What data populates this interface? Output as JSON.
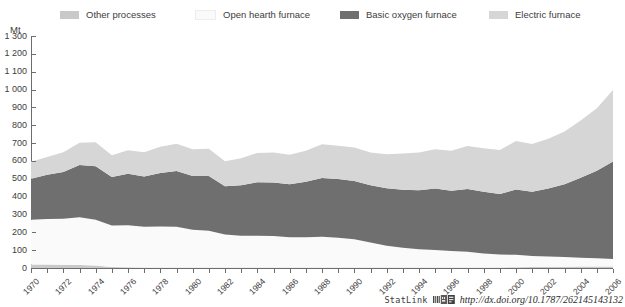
{
  "legend": {
    "position": "top",
    "items": [
      {
        "label": "Other processes",
        "color": "#c9c9c9"
      },
      {
        "label": "Open hearth furnace",
        "color": "#fafafa"
      },
      {
        "label": "Basic oxygen furnace",
        "color": "#6f6f6f"
      },
      {
        "label": "Electric furnace",
        "color": "#d6d6d6"
      }
    ]
  },
  "footer": {
    "statlink_label": "StatLink",
    "statlink_icon": "statlink-barcode-icon",
    "url": "http://dx.doi.org/10.1787/262145143132"
  },
  "chart_data": {
    "type": "area",
    "stacked": true,
    "title": "",
    "subtitle": "",
    "xlabel": "",
    "ylabel": "Mt",
    "ylim": [
      0,
      1300
    ],
    "ytick_step": 100,
    "ytick_labels": [
      "0",
      "100",
      "200",
      "300",
      "400",
      "500",
      "600",
      "700",
      "800",
      "900",
      "1 000",
      "1 100",
      "1 200",
      "1 300"
    ],
    "grid": false,
    "xlim": [
      1970,
      2006
    ],
    "x": [
      1970,
      1971,
      1972,
      1973,
      1974,
      1975,
      1976,
      1977,
      1978,
      1979,
      1980,
      1981,
      1982,
      1983,
      1984,
      1985,
      1986,
      1987,
      1988,
      1989,
      1990,
      1991,
      1992,
      1993,
      1994,
      1995,
      1996,
      1997,
      1998,
      1999,
      2000,
      2001,
      2002,
      2003,
      2004,
      2005,
      2006
    ],
    "xtick_labels": [
      "1970",
      "1972",
      "1974",
      "1976",
      "1978",
      "1980",
      "1982",
      "1984",
      "1986",
      "1988",
      "1990",
      "1992",
      "1994",
      "1996",
      "1998",
      "2000",
      "2002",
      "2004",
      "2006"
    ],
    "xtick_label_every": 2,
    "series": [
      {
        "name": "Other processes",
        "color": "#c9c9c9",
        "values": [
          20,
          19,
          18,
          17,
          14,
          6,
          4,
          3,
          3,
          3,
          3,
          3,
          3,
          3,
          3,
          3,
          3,
          3,
          3,
          3,
          3,
          3,
          3,
          3,
          3,
          3,
          3,
          3,
          3,
          3,
          4,
          5,
          6,
          7,
          8,
          9,
          9
        ]
      },
      {
        "name": "Open hearth furnace",
        "color": "#fafafa",
        "values": [
          250,
          255,
          258,
          268,
          256,
          232,
          236,
          228,
          230,
          228,
          212,
          206,
          185,
          178,
          178,
          176,
          170,
          170,
          172,
          166,
          158,
          140,
          122,
          110,
          102,
          98,
          92,
          88,
          78,
          72,
          70,
          62,
          58,
          54,
          50,
          46,
          42
        ]
      },
      {
        "name": "Basic oxygen furnace",
        "color": "#6f6f6f",
        "values": [
          230,
          248,
          262,
          292,
          300,
          272,
          288,
          282,
          300,
          312,
          300,
          306,
          270,
          282,
          300,
          300,
          296,
          310,
          330,
          330,
          326,
          320,
          322,
          326,
          330,
          344,
          338,
          352,
          346,
          340,
          366,
          360,
          382,
          408,
          448,
          490,
          546
        ]
      },
      {
        "name": "Electric furnace",
        "color": "#d6d6d6",
        "values": [
          95,
          100,
          110,
          125,
          134,
          122,
          132,
          136,
          146,
          153,
          150,
          153,
          140,
          152,
          164,
          168,
          166,
          174,
          188,
          186,
          188,
          184,
          190,
          202,
          212,
          220,
          224,
          240,
          244,
          246,
          272,
          268,
          278,
          296,
          320,
          350,
          400
        ]
      }
    ]
  }
}
